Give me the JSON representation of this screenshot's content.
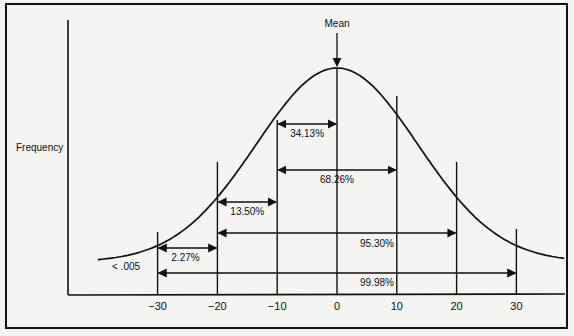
{
  "chart_data": {
    "type": "area",
    "title": "",
    "subtitle": "",
    "xlabel": "",
    "ylabel": "Frequency",
    "x_ticks": [
      -30,
      -20,
      -10,
      0,
      10,
      20,
      30
    ],
    "x_tick_labels": [
      "−30",
      "−20",
      "−10",
      "0",
      "10",
      "20",
      "30"
    ],
    "xlim": [
      -38,
      38
    ],
    "mean_label": "Mean",
    "mean_x": 0,
    "distribution": "normal",
    "sd": 10,
    "grid": false,
    "legend": "none",
    "tail_label": "< .005",
    "annotations": [
      {
        "label": "34.13%",
        "from": -10,
        "to": 0
      },
      {
        "label": "68.26%",
        "from": -10,
        "to": 10
      },
      {
        "label": "13.50%",
        "from": -20,
        "to": -10
      },
      {
        "label": "95.30%",
        "from": -20,
        "to": 20
      },
      {
        "label": "2.27%",
        "from": -30,
        "to": -20
      },
      {
        "label": "99.98%",
        "from": -30,
        "to": 30
      }
    ]
  },
  "colors": {
    "ink": "#111111",
    "paper": "#f4f4f2"
  }
}
